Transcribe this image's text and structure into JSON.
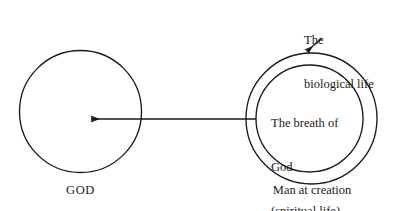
{
  "figure": {
    "type": "diagram",
    "background_color": "#ffffff",
    "stroke_color": "#1a1a1a",
    "text_color": "#1a1a1a"
  },
  "shapes": {
    "god_circle": {
      "name": "GOD",
      "cx": 80.5,
      "cy": 111.5,
      "r": 61
    },
    "man_outer_circle": {
      "name": "The biological life",
      "cx": 311.5,
      "cy": 118.5,
      "r": 65.5
    },
    "man_inner_circle": {
      "name": "The breath of God (spiritual life)",
      "cx": 309.5,
      "cy": 118.5,
      "r": 53.5
    }
  },
  "arrows": {
    "main": {
      "label": "arrow from man to God",
      "x1": 256,
      "y1": 119,
      "x2": 88,
      "y2": 119,
      "direction": "left"
    },
    "biological_pointer": {
      "label": "pointer from biological life label to outer circle",
      "x1": 322,
      "y1": 38,
      "x2": 305,
      "y2": 53,
      "direction": "down-left"
    }
  },
  "labels": {
    "god": "GOD",
    "man_at_creation": "Man at creation",
    "biological_life": {
      "line1": "The",
      "line2": "biological life"
    },
    "breath_of_god": {
      "line1": "The breath of",
      "line2": "God",
      "line3": "(spiritual life)"
    }
  }
}
